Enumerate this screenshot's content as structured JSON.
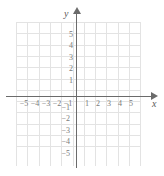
{
  "chart_data": {
    "type": "scatter",
    "title": "",
    "subtitle": "",
    "xlabel": "x",
    "ylabel": "y",
    "xlim": [
      -6,
      6
    ],
    "ylim": [
      -6,
      6
    ],
    "x_ticks": [
      -5,
      -4,
      -3,
      -2,
      -1,
      1,
      2,
      3,
      4,
      5
    ],
    "y_ticks": [
      5,
      4,
      3,
      2,
      1,
      -1,
      -2,
      -3,
      -4,
      -5
    ],
    "x_tick_labels": [
      "−5",
      "−4",
      "−3",
      "−2",
      "−1",
      "1",
      "2",
      "3",
      "4",
      "5"
    ],
    "y_tick_labels": [
      "5",
      "4",
      "3",
      "2",
      "1",
      "−1",
      "−2",
      "−3",
      "−4",
      "−5"
    ],
    "grid": true,
    "grid_columns": 11,
    "grid_rows": 11,
    "legend": null,
    "series": [],
    "values": [],
    "annotations": [],
    "origin_label": "",
    "colors": {
      "grid": "#e3e3e3",
      "axis": "#6b6b6b",
      "tick_text": "#7a7a7a",
      "axis_name": "#5a5a5a",
      "background": "#ffffff"
    }
  },
  "axes": {
    "x_name": "x",
    "y_name": "y",
    "x_arrow": "arrow-right-icon",
    "y_arrow": "arrow-up-icon"
  },
  "x_labels": [
    {
      "text": "−5",
      "left": 18,
      "top": 100
    },
    {
      "text": "−4",
      "left": 29,
      "top": 100
    },
    {
      "text": "−3",
      "left": 40,
      "top": 100
    },
    {
      "text": "−2",
      "left": 51,
      "top": 100
    },
    {
      "text": "−1",
      "left": 62,
      "top": 100
    },
    {
      "text": "1",
      "left": 81,
      "top": 100
    },
    {
      "text": "2",
      "left": 92,
      "top": 100
    },
    {
      "text": "3",
      "left": 103,
      "top": 100
    },
    {
      "text": "4",
      "left": 114,
      "top": 100
    },
    {
      "text": "5",
      "left": 125,
      "top": 100
    }
  ],
  "y_labels": [
    {
      "text": "5",
      "left": 63,
      "top": 31
    },
    {
      "text": "4",
      "left": 63,
      "top": 42
    },
    {
      "text": "3",
      "left": 63,
      "top": 54
    },
    {
      "text": "2",
      "left": 63,
      "top": 65
    },
    {
      "text": "1",
      "left": 63,
      "top": 77
    },
    {
      "text": "−1",
      "left": 60,
      "top": 104
    },
    {
      "text": "−2",
      "left": 60,
      "top": 115
    },
    {
      "text": "−3",
      "left": 60,
      "top": 127
    },
    {
      "text": "−4",
      "left": 60,
      "top": 138
    },
    {
      "text": "−5",
      "left": 60,
      "top": 150
    }
  ],
  "grid_geometry": {
    "left": 16,
    "top": 22,
    "cell": 11.3,
    "columns": 11,
    "rows": 11
  }
}
